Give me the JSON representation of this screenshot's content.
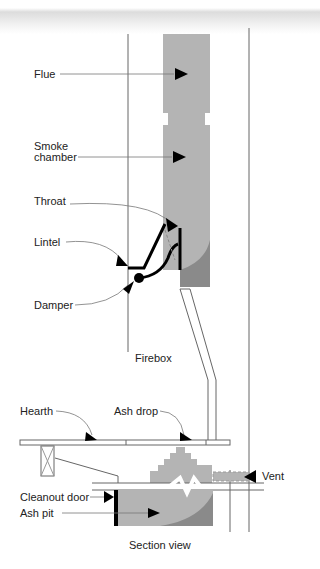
{
  "diagram": {
    "caption": "Section view",
    "labels": {
      "flue": "Flue",
      "smoke_chamber_1": "Smoke",
      "smoke_chamber_2": "chamber",
      "throat": "Throat",
      "lintel": "Lintel",
      "damper": "Damper",
      "firebox": "Firebox",
      "hearth": "Hearth",
      "ash_drop": "Ash drop",
      "vent": "Vent",
      "cleanout_door": "Cleanout door",
      "ash_pit": "Ash pit"
    },
    "colors": {
      "masonry": "#b4b4b4",
      "masonry_dark": "#8a8a8a",
      "line": "#555555",
      "arrow": "#000000"
    }
  }
}
